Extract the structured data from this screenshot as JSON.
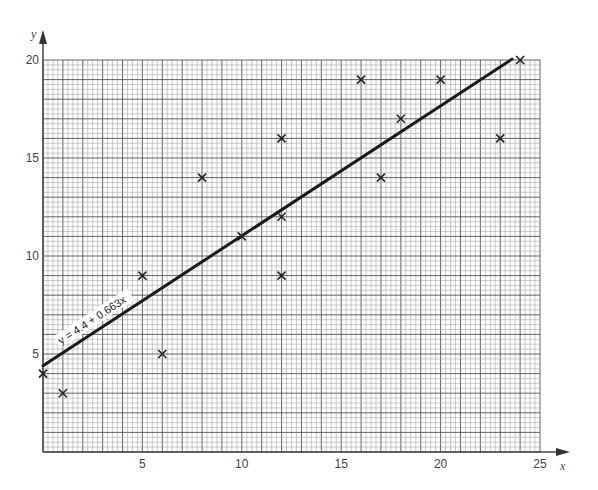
{
  "chart_data": {
    "type": "scatter",
    "title": "",
    "xlabel": "x",
    "ylabel": "y",
    "xlim": [
      0,
      25
    ],
    "ylim": [
      0,
      20
    ],
    "x_ticks": [
      5,
      10,
      15,
      20,
      25
    ],
    "y_ticks": [
      5,
      10,
      15,
      20
    ],
    "grid": true,
    "legend": null,
    "points": [
      {
        "x": 0,
        "y": 4
      },
      {
        "x": 1,
        "y": 3
      },
      {
        "x": 5,
        "y": 9
      },
      {
        "x": 6,
        "y": 5
      },
      {
        "x": 8,
        "y": 14
      },
      {
        "x": 10,
        "y": 11
      },
      {
        "x": 12,
        "y": 16
      },
      {
        "x": 12,
        "y": 12
      },
      {
        "x": 12,
        "y": 9
      },
      {
        "x": 16,
        "y": 19
      },
      {
        "x": 17,
        "y": 14
      },
      {
        "x": 18,
        "y": 17
      },
      {
        "x": 20,
        "y": 19
      },
      {
        "x": 23,
        "y": 16
      },
      {
        "x": 24,
        "y": 20
      }
    ],
    "regression_line": {
      "intercept": 4.4,
      "slope": 0.663,
      "label": "y = 4.4 + 0.663x",
      "x_start": 0,
      "x_end": 23.6
    },
    "annotations": [
      "y = 4.4 + 0.663x"
    ]
  },
  "axes": {
    "x_label": "x",
    "y_label": "y",
    "x_tick_labels": [
      "5",
      "10",
      "15",
      "20",
      "25"
    ],
    "y_tick_labels": [
      "5",
      "10",
      "15",
      "20"
    ]
  },
  "colors": {
    "grid_minor": "#9a9a9a",
    "grid_major": "#555555",
    "line": "#1a1a1a",
    "marker": "#222222"
  }
}
